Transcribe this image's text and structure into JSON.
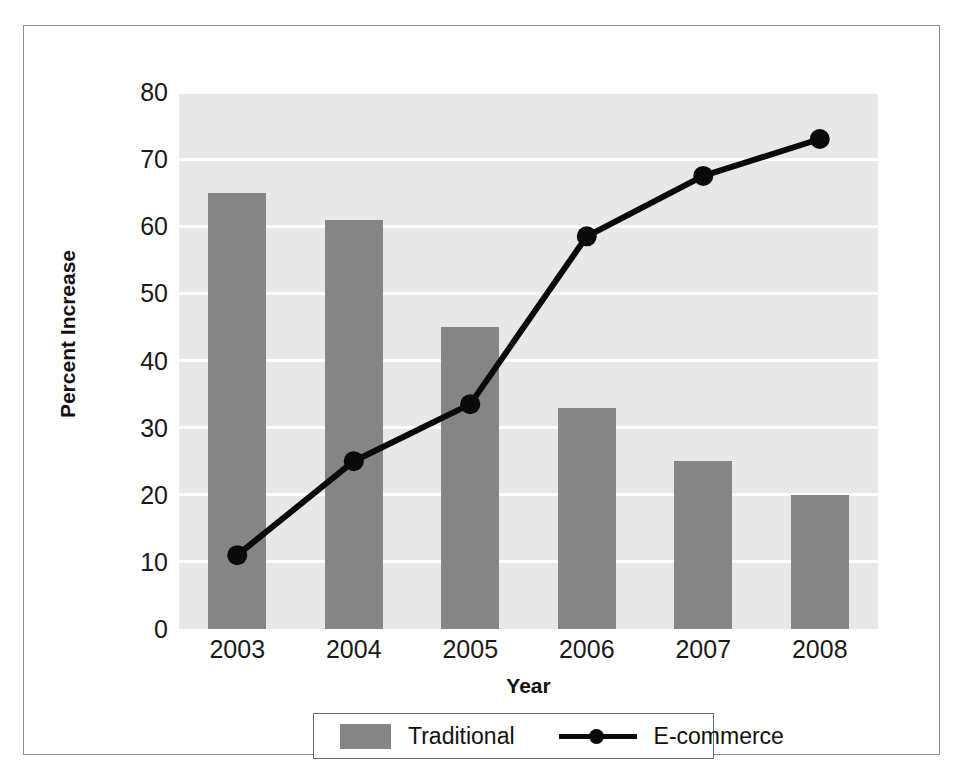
{
  "chart_data": {
    "type": "bar",
    "title": "",
    "xlabel": "Year",
    "ylabel": "Percent Increase",
    "categories": [
      "2003",
      "2004",
      "2005",
      "2006",
      "2007",
      "2008"
    ],
    "ylim": [
      0,
      80
    ],
    "yticks": [
      0,
      10,
      20,
      30,
      40,
      50,
      60,
      70,
      80
    ],
    "ytick_labels": [
      "0",
      "10",
      "20",
      "30",
      "40",
      "50",
      "60",
      "70",
      "80"
    ],
    "grid": true,
    "grid_axis": "y",
    "legend_position": "bottom",
    "series": [
      {
        "name": "Traditional",
        "type": "bar",
        "color": "#858585",
        "values": [
          65,
          61,
          45,
          33,
          25,
          20
        ]
      },
      {
        "name": "E-commerce",
        "type": "line",
        "color": "#0a0a0a",
        "marker": "circle",
        "values": [
          11,
          25,
          33.5,
          58.5,
          67.5,
          73
        ]
      }
    ]
  },
  "axes": {
    "x_label": "Year",
    "y_label": "Percent Increase"
  },
  "legend": {
    "items": [
      {
        "label": "Traditional",
        "swatch": "bar-swatch",
        "color": "#858585"
      },
      {
        "label": "E-commerce",
        "swatch": "line-marker-swatch",
        "color": "#0a0a0a"
      }
    ]
  },
  "colors": {
    "bar_gray": "#858585",
    "plot_background": "#e8e8e8",
    "gridline": "#fdfdfd",
    "line_black": "#0a0a0a",
    "frame_border": "#8e8e8e",
    "text": "#111111"
  }
}
